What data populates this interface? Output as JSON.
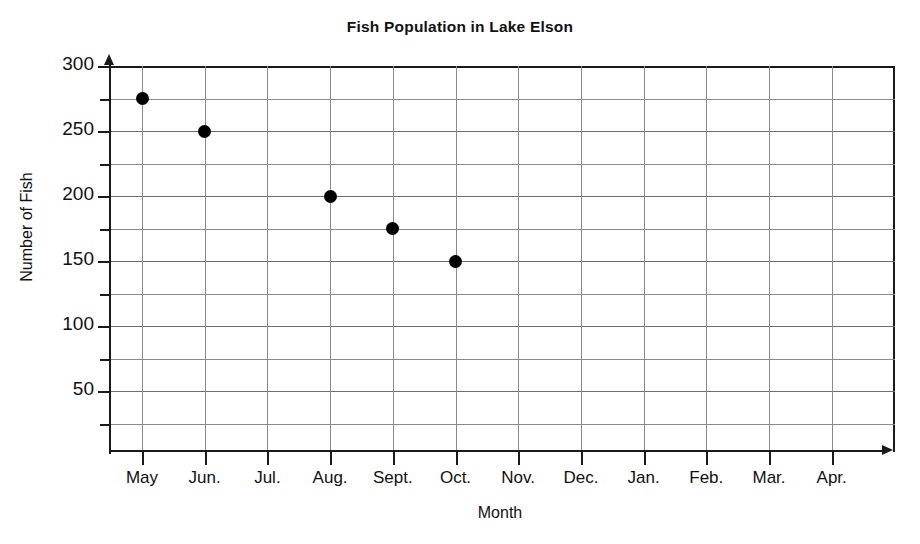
{
  "chart_data": {
    "type": "scatter",
    "title": "Fish Population in Lake Elson",
    "xlabel": "Month",
    "ylabel": "Number of Fish",
    "categories": [
      "May",
      "Jun.",
      "Jul.",
      "Aug.",
      "Sept.",
      "Oct.",
      "Nov.",
      "Dec.",
      "Jan.",
      "Feb.",
      "Mar.",
      "Apr."
    ],
    "values": [
      275,
      250,
      null,
      200,
      175,
      150,
      null,
      null,
      null,
      null,
      null,
      null
    ],
    "points": [
      {
        "x": "May",
        "y": 275
      },
      {
        "x": "Jun.",
        "y": 250
      },
      {
        "x": "Aug.",
        "y": 200
      },
      {
        "x": "Sept.",
        "y": 175
      },
      {
        "x": "Oct.",
        "y": 150
      }
    ],
    "ylim": [
      0,
      300
    ],
    "y_major_ticks": [
      50,
      100,
      150,
      200,
      250,
      300
    ],
    "y_minor_ticks": [
      25,
      75,
      125,
      175,
      225,
      275
    ],
    "y_tick_labels": [
      "50",
      "100",
      "150",
      "200",
      "250",
      "300"
    ],
    "grid": true,
    "legend": null,
    "marker": "filled-circle",
    "marker_color": "#000000",
    "grid_color": "#8a8a8a",
    "axis_color": "#1a1a1a",
    "background_color": "#ffffff"
  }
}
